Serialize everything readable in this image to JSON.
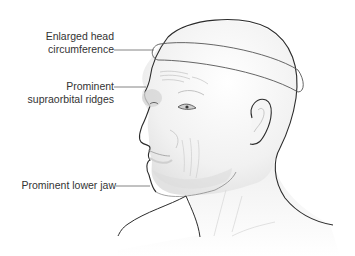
{
  "figure": {
    "labels": [
      {
        "id": "head",
        "line1": "Enlarged head",
        "line2": "circumference"
      },
      {
        "id": "ridges",
        "line1": "Prominent",
        "line2": "supraorbital ridges"
      },
      {
        "id": "jaw",
        "line1": "Prominent lower jaw",
        "line2": ""
      }
    ],
    "colors": {
      "outline": "#2b2b2b",
      "leader": "#666666",
      "skin_shade": "#d8d8d8",
      "text": "#333333"
    }
  }
}
